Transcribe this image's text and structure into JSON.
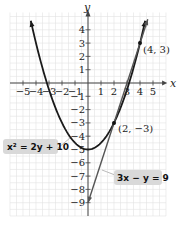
{
  "chart_data": {
    "type": "line",
    "title": "",
    "xlabel": "x",
    "ylabel": "y",
    "xlim": [
      -6,
      6
    ],
    "ylim": [
      -10,
      5
    ],
    "grid": true,
    "x_ticks": [
      -5,
      -4,
      -3,
      -2,
      -1,
      1,
      2,
      3,
      4,
      5
    ],
    "x_tick_labels": [
      "−5",
      "−4",
      "−3",
      "−2",
      "−1",
      "1",
      "2",
      "3",
      "4",
      "5"
    ],
    "y_ticks": [
      4,
      3,
      2,
      1,
      -1,
      -2,
      -3,
      -4,
      -5,
      -6,
      -7,
      -8,
      -9
    ],
    "y_tick_labels": [
      "4",
      "3",
      "2",
      "1",
      "−1",
      "−2",
      "−3",
      "−4",
      "−5",
      "−6",
      "−7",
      "−8",
      "−9"
    ],
    "series": [
      {
        "name": "x² = 2y + 10",
        "kind": "parabola",
        "equation": "y = (x^2 - 10) / 2",
        "x_range": [
          -4.4,
          4.4
        ],
        "color": "#1a1a1a"
      },
      {
        "name": "3x − y = 9",
        "kind": "line",
        "equation": "y = 3x - 9",
        "x_range": [
          0,
          4.6
        ],
        "color": "#555555"
      }
    ],
    "points": [
      {
        "x": 4,
        "y": 3,
        "label": "(4, 3)"
      },
      {
        "x": 2,
        "y": -3,
        "label": "(2, −3)"
      }
    ],
    "annotations": [
      {
        "text": "x² = 2y + 10",
        "target": "parabola"
      },
      {
        "text": "3x − y = 9",
        "target": "line"
      }
    ]
  },
  "labels": {
    "x_axis": "x",
    "y_axis": "y",
    "point_a": "(4, 3)",
    "point_b": "(2, −3)",
    "eq_parabola": "x² = 2y + 10",
    "eq_line": "3x − y = 9"
  }
}
